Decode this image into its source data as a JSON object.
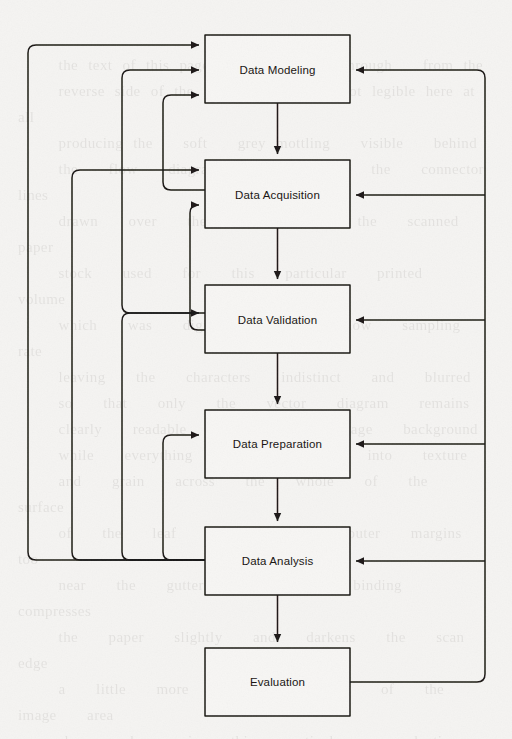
{
  "diagram": {
    "type": "flowchart",
    "orientation": "vertical",
    "stroke_color": "#1a1714",
    "background_color": "#f5f4f2",
    "nodes": [
      {
        "id": "data-modeling",
        "label": "Data Modeling",
        "x": 205,
        "y": 35,
        "w": 145,
        "h": 68
      },
      {
        "id": "data-acquisition",
        "label": "Data Acquisition",
        "x": 205,
        "y": 160,
        "w": 145,
        "h": 68
      },
      {
        "id": "data-validation",
        "label": "Data Validation",
        "x": 205,
        "y": 285,
        "w": 145,
        "h": 68
      },
      {
        "id": "data-preparation",
        "label": "Data Preparation",
        "x": 205,
        "y": 410,
        "w": 145,
        "h": 68
      },
      {
        "id": "data-analysis",
        "label": "Data Analysis",
        "x": 205,
        "y": 527,
        "w": 145,
        "h": 68
      },
      {
        "id": "evaluation",
        "label": "Evaluation",
        "x": 205,
        "y": 648,
        "w": 145,
        "h": 68
      }
    ],
    "forward_edges": [
      {
        "from": "data-modeling",
        "to": "data-acquisition"
      },
      {
        "from": "data-acquisition",
        "to": "data-validation"
      },
      {
        "from": "data-validation",
        "to": "data-preparation"
      },
      {
        "from": "data-preparation",
        "to": "data-analysis"
      },
      {
        "from": "data-analysis",
        "to": "evaluation"
      }
    ],
    "feedback_edges_left": [
      {
        "from": "data-analysis",
        "to": "data-modeling",
        "bus_x": 28
      },
      {
        "from": "data-analysis",
        "to": "data-acquisition",
        "bus_x": 72
      },
      {
        "from": "data-analysis",
        "to": "data-validation",
        "bus_x": 122
      },
      {
        "from": "data-analysis",
        "to": "data-preparation",
        "bus_x": 163
      }
    ],
    "feedback_edges_right": [
      {
        "from": "evaluation",
        "to": "data-modeling",
        "bus_x": 485
      },
      {
        "from": "evaluation",
        "to": "data-acquisition",
        "bus_x": 485
      },
      {
        "from": "evaluation",
        "to": "data-validation",
        "bus_x": 485
      },
      {
        "from": "evaluation",
        "to": "data-preparation",
        "bus_x": 485
      },
      {
        "from": "evaluation",
        "to": "data-analysis",
        "bus_x": 485
      }
    ]
  },
  "labels": {
    "n0": "Data Modeling",
    "n1": "Data Acquisition",
    "n2": "Data Validation",
    "n3": "Data Preparation",
    "n4": "Data Analysis",
    "n5": "Evaluation"
  },
  "page_bleed_text": "the scanned page shows faint show-through of text from the reverse side of the sheet; the words are not legible at this resolution and carry no information"
}
